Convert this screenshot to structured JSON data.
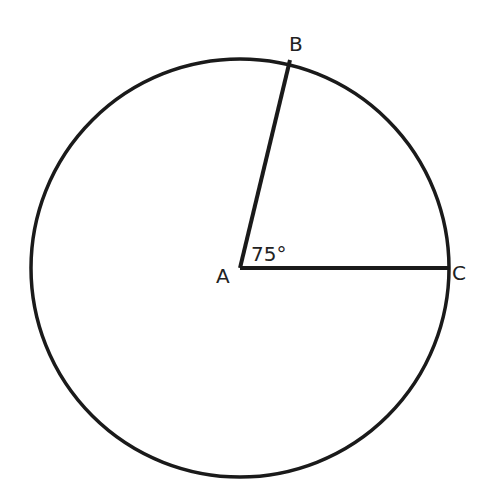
{
  "diagram": {
    "type": "circle-central-angle",
    "center": {
      "label": "A",
      "x": 240,
      "y": 268
    },
    "radius": 210,
    "points": [
      {
        "label": "B",
        "x": 290,
        "y": 61
      },
      {
        "label": "C",
        "x": 447,
        "y": 268
      }
    ],
    "segments": [
      {
        "from": "A",
        "to": "B"
      },
      {
        "from": "A",
        "to": "C"
      }
    ],
    "angle": {
      "vertex": "A",
      "between": [
        "B",
        "C"
      ],
      "label": "75°",
      "value_deg": 75
    },
    "stroke_color": "#1a1a1a"
  },
  "labels": {
    "A": "A",
    "B": "B",
    "C": "C",
    "angle": "75°"
  }
}
